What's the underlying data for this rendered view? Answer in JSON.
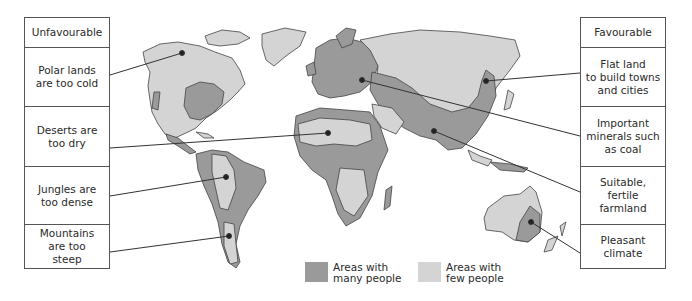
{
  "colors": {
    "many_people": "#9a9a9a",
    "few_people": "#d4d4d4",
    "outline": "#444444",
    "background": "#ffffff"
  },
  "left_panel": {
    "title": "Unfavourable",
    "items": [
      {
        "label": "Polar lands\nare too cold"
      },
      {
        "label": "Deserts are\ntoo dry"
      },
      {
        "label": "Jungles are\ntoo dense"
      },
      {
        "label": "Mountains\nare too\nsteep"
      }
    ]
  },
  "right_panel": {
    "title": "Favourable",
    "items": [
      {
        "label": "Flat land\nto build towns\nand cities"
      },
      {
        "label": "Important\nminerals such\nas coal"
      },
      {
        "label": "Suitable,\nfertile\nfarmland"
      },
      {
        "label": "Pleasant\nclimate"
      }
    ]
  },
  "legend": [
    {
      "label": "Areas with\nmany people",
      "key": "many_people"
    },
    {
      "label": "Areas with\nfew people",
      "key": "few_people"
    }
  ]
}
